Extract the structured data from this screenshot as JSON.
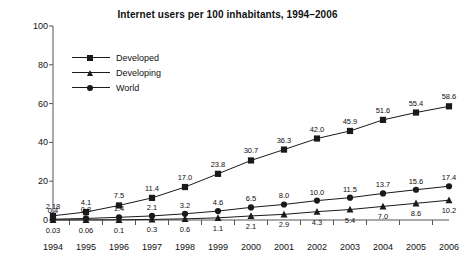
{
  "chart_data": {
    "type": "line",
    "title": "Internet users per 100 inhabitants, 1994–2006",
    "xlabel": "",
    "ylabel": "",
    "categories": [
      "1994",
      "1995",
      "1996",
      "1997",
      "1998",
      "1999",
      "2000",
      "2001",
      "2002",
      "2003",
      "2004",
      "2005",
      "2006"
    ],
    "yticks": [
      0,
      20,
      40,
      60,
      80,
      100
    ],
    "ylim": [
      0,
      100
    ],
    "grid": false,
    "legend_position": "upper-left-inside",
    "series": [
      {
        "name": "Developed",
        "marker": "square",
        "values": [
          2.18,
          4.1,
          7.5,
          11.4,
          17.0,
          23.8,
          30.7,
          36.3,
          42.0,
          45.9,
          51.6,
          55.4,
          58.6
        ],
        "labels": [
          "2.18",
          "4.1",
          "7.5",
          "11.4",
          "17.0",
          "23.8",
          "30.7",
          "36.3",
          "42.0",
          "45.9",
          "51.6",
          "55.4",
          "58.6"
        ]
      },
      {
        "name": "Developing",
        "marker": "triangle",
        "values": [
          0.03,
          0.06,
          0.1,
          0.3,
          0.6,
          1.1,
          2.1,
          2.9,
          4.3,
          5.4,
          7.0,
          8.6,
          10.2
        ],
        "labels": [
          "0.03",
          "0.06",
          "0.1",
          "0.3",
          "0.6",
          "1.1",
          "2.1",
          "2.9",
          "4.3",
          "5.4",
          "7.0",
          "8.6",
          "10.2"
        ]
      },
      {
        "name": "World",
        "marker": "circle",
        "values": [
          0.4,
          0.8,
          1.4,
          2.1,
          3.2,
          4.6,
          6.5,
          8.0,
          10.0,
          11.5,
          13.7,
          15.6,
          17.4
        ],
        "labels": [
          "0.4",
          "0.8",
          "1.4",
          "2.1",
          "3.2",
          "4.6",
          "6.5",
          "8.0",
          "10.0",
          "11.5",
          "13.7",
          "15.6",
          "17.4"
        ]
      }
    ]
  }
}
